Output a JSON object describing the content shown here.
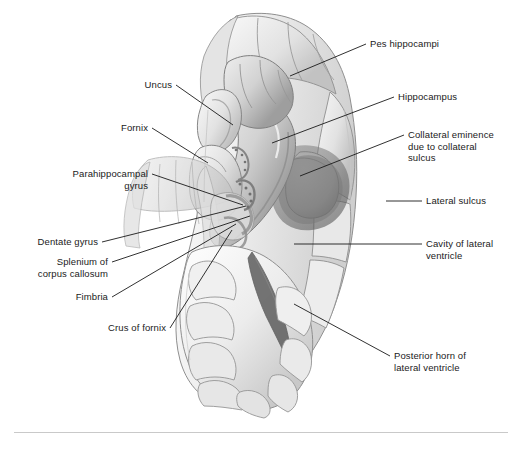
{
  "figure": {
    "kind": "anatomical-illustration",
    "style": "grayscale shaded line drawing",
    "background_color": "#ffffff",
    "ink_color": "#1a1a1a",
    "tissue_light": "#f2f2f2",
    "tissue_mid": "#d9d9d9",
    "tissue_shadow": "#a8a8a8",
    "tissue_dark": "#6f6f6f",
    "cavity_dark": "#5c5c5c",
    "outline_color": "#7a7a7a"
  },
  "labels": [
    {
      "id": "pes-hippocampi",
      "text": "Pes hippocampi",
      "side": "right",
      "lines": [
        "Pes hippocampi"
      ],
      "text_x": 370,
      "text_y": 38,
      "leader_from_x": 366,
      "leader_from_y": 44,
      "leader_to_x": 290,
      "leader_to_y": 76
    },
    {
      "id": "uncus",
      "text": "Uncus",
      "side": "left",
      "lines": [
        "Uncus"
      ],
      "text_x": 108,
      "text_y": 79,
      "text_w": 64,
      "leader_from_x": 176,
      "leader_from_y": 85,
      "leader_to_x": 233,
      "leader_to_y": 125
    },
    {
      "id": "hippocampus",
      "text": "Hippocampus",
      "side": "right",
      "lines": [
        "Hippocampus"
      ],
      "text_x": 398,
      "text_y": 91,
      "leader_from_x": 394,
      "leader_from_y": 97,
      "leader_to_x": 272,
      "leader_to_y": 143
    },
    {
      "id": "fornix",
      "text": "Fornix",
      "side": "left",
      "lines": [
        "Fornix"
      ],
      "text_x": 84,
      "text_y": 122,
      "text_w": 64,
      "leader_from_x": 152,
      "leader_from_y": 128,
      "leader_to_x": 208,
      "leader_to_y": 163
    },
    {
      "id": "collateral-eminence",
      "text": "Collateral eminence due to collateral sulcus",
      "side": "right",
      "lines": [
        "Collateral eminence",
        "due to collateral",
        "sulcus"
      ],
      "text_x": 408,
      "text_y": 129,
      "leader_from_x": 404,
      "leader_from_y": 135,
      "leader_to_x": 300,
      "leader_to_y": 176
    },
    {
      "id": "parahippocampal-gyrus",
      "text": "Parahippocampal gyrus",
      "side": "left",
      "lines": [
        "Parahippocampal",
        "gyrus"
      ],
      "text_x": 28,
      "text_y": 168,
      "text_w": 120,
      "leader_from_x": 152,
      "leader_from_y": 174,
      "leader_to_x": 243,
      "leader_to_y": 205
    },
    {
      "id": "lateral-sulcus",
      "text": "Lateral sulcus",
      "side": "right",
      "lines": [
        "Lateral sulcus"
      ],
      "text_x": 426,
      "text_y": 195,
      "leader_from_x": 422,
      "leader_from_y": 201,
      "leader_to_x": 386,
      "leader_to_y": 201
    },
    {
      "id": "dentate-gyrus",
      "text": "Dentate gyrus",
      "side": "left",
      "lines": [
        "Dentate gyrus"
      ],
      "text_x": 22,
      "text_y": 236,
      "text_w": 76,
      "leader_from_x": 102,
      "leader_from_y": 242,
      "leader_to_x": 246,
      "leader_to_y": 206
    },
    {
      "id": "cavity-lateral-ventricle",
      "text": "Cavity of lateral ventricle",
      "side": "right",
      "lines": [
        "Cavity of lateral",
        "ventricle"
      ],
      "text_x": 426,
      "text_y": 238,
      "leader_from_x": 422,
      "leader_from_y": 244,
      "leader_to_x": 294,
      "leader_to_y": 244
    },
    {
      "id": "splenium-corpus-callosum",
      "text": "Splenium of corpus callosum",
      "side": "left",
      "lines": [
        "Splenium of",
        "corpus callosum"
      ],
      "text_x": 22,
      "text_y": 256,
      "text_w": 86,
      "leader_from_x": 112,
      "leader_from_y": 262,
      "leader_to_x": 250,
      "leader_to_y": 216
    },
    {
      "id": "fimbria",
      "text": "Fimbria",
      "side": "left",
      "lines": [
        "Fimbria"
      ],
      "text_x": 42,
      "text_y": 291,
      "text_w": 66,
      "leader_from_x": 112,
      "leader_from_y": 297,
      "leader_to_x": 236,
      "leader_to_y": 224
    },
    {
      "id": "crus-of-fornix",
      "text": "Crus of fornix",
      "side": "left",
      "lines": [
        "Crus of fornix"
      ],
      "text_x": 90,
      "text_y": 322,
      "text_w": 76,
      "leader_from_x": 170,
      "leader_from_y": 328,
      "leader_to_x": 232,
      "leader_to_y": 230
    },
    {
      "id": "posterior-horn",
      "text": "Posterior horn of lateral ventricle",
      "side": "right",
      "lines": [
        "Posterior horn of",
        "lateral ventricle"
      ],
      "text_x": 394,
      "text_y": 350,
      "leader_from_x": 390,
      "leader_from_y": 356,
      "leader_to_x": 294,
      "leader_to_y": 304
    }
  ],
  "caption": {
    "rule_visible": true,
    "text": ""
  }
}
